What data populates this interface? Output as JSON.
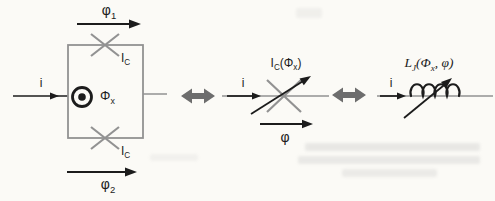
{
  "colors": {
    "bg": "#fbfaf6",
    "ink": "#1c1c1c",
    "line-gray": "#929292",
    "arrow-gray": "#6d6d6d",
    "bleed": "#b9b9b9"
  },
  "icons": {
    "equivalence_connector": "thick-double-headed-arrow",
    "flux_symbol": "circled-dot-out-of-page"
  },
  "panels": {
    "squid_loop": {
      "current": "i",
      "phase_top": {
        "base": "φ",
        "sub": "1"
      },
      "phase_bottom": {
        "base": "φ",
        "sub": "2"
      },
      "junction_top_critical_current": {
        "base": "I",
        "sub": "C"
      },
      "junction_bottom_critical_current": {
        "base": "I",
        "sub": "C"
      },
      "external_flux": {
        "base": "Φ",
        "sub": "x"
      }
    },
    "effective_junction": {
      "current": "i",
      "critical_current": {
        "pre": "I",
        "pre_sub": "C",
        "arg_open": "(Φ",
        "arg_sub": "x",
        "arg_close": ")"
      },
      "phase": "φ"
    },
    "josephson_inductance": {
      "current": "i",
      "inductance": {
        "pre": "L",
        "pre_sub": "J",
        "arg_open": "(Φ",
        "arg_sub": "x",
        "arg_close": ", φ)"
      }
    }
  }
}
